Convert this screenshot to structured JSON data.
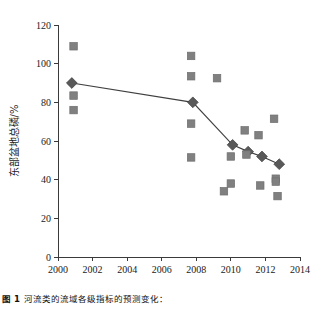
{
  "chart_data": {
    "type": "scatter",
    "title": "",
    "xlabel": "年份",
    "ylabel": "东部盆地总磷/%",
    "xlim": [
      2000,
      2014
    ],
    "ylim": [
      0,
      120
    ],
    "xticks": [
      2000,
      2002,
      2004,
      2006,
      2008,
      2010,
      2012,
      2014
    ],
    "yticks": [
      0,
      20,
      40,
      60,
      80,
      100,
      120
    ],
    "grid": false,
    "legend": "none",
    "series": [
      {
        "name": "均值趋势线",
        "marker": "diamond",
        "color": "#595959",
        "line": true,
        "line_color": "#3f3f3f",
        "points": [
          {
            "x": 2000.8,
            "y": 90.0
          },
          {
            "x": 2007.8,
            "y": 80.0
          },
          {
            "x": 2010.1,
            "y": 58.0
          },
          {
            "x": 2011.0,
            "y": 54.5
          },
          {
            "x": 2011.8,
            "y": 52.0
          },
          {
            "x": 2012.8,
            "y": 48.0
          }
        ]
      },
      {
        "name": "观测值",
        "marker": "square",
        "color": "#808080",
        "line": false,
        "points": [
          {
            "x": 2000.9,
            "y": 109.0
          },
          {
            "x": 2000.9,
            "y": 83.5
          },
          {
            "x": 2000.9,
            "y": 76.0
          },
          {
            "x": 2007.7,
            "y": 104.0
          },
          {
            "x": 2007.7,
            "y": 93.5
          },
          {
            "x": 2007.7,
            "y": 69.0
          },
          {
            "x": 2007.7,
            "y": 51.5
          },
          {
            "x": 2009.2,
            "y": 92.5
          },
          {
            "x": 2009.6,
            "y": 34.0
          },
          {
            "x": 2010.0,
            "y": 52.0
          },
          {
            "x": 2010.0,
            "y": 38.0
          },
          {
            "x": 2010.8,
            "y": 65.5
          },
          {
            "x": 2010.9,
            "y": 53.0
          },
          {
            "x": 2011.6,
            "y": 63.0
          },
          {
            "x": 2011.7,
            "y": 37.0
          },
          {
            "x": 2012.5,
            "y": 71.5
          },
          {
            "x": 2012.6,
            "y": 40.5
          },
          {
            "x": 2012.6,
            "y": 39.0
          },
          {
            "x": 2012.7,
            "y": 31.5
          }
        ]
      }
    ]
  },
  "caption": {
    "label": "图 1",
    "text": "河流类的流域各级指标的预测变化："
  }
}
